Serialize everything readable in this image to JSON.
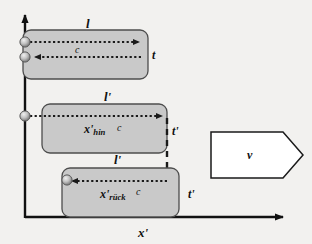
{
  "figure": {
    "background_color": "#f2f1ef",
    "box_fill_color": "#c9c9c9",
    "box_stroke_color": "#4d4d4d",
    "line_color": "#1a1a1a",
    "velocity_box_fill": "#ffffff"
  },
  "axes": {
    "x_axis_label": "x'",
    "y_axis_label": "",
    "x_axis_name": "horizontal-axis",
    "y_axis_name": "vertical-axis"
  },
  "frames": [
    {
      "id": "rest-frame",
      "length_label": "l",
      "speed_label": "c",
      "time_label": "t",
      "distance_label": "",
      "arrow_direction": "right",
      "markers": 2
    },
    {
      "id": "moving-frame-outbound",
      "length_label": "l'",
      "speed_label": "c",
      "time_label": "t'",
      "distance_label": "x'",
      "distance_subscript": "hin",
      "arrow_direction": "right",
      "markers": 1
    },
    {
      "id": "moving-frame-return",
      "length_label": "l'",
      "speed_label": "c",
      "time_label": "t'",
      "distance_label": "x'",
      "distance_subscript": "rück",
      "arrow_direction": "left",
      "markers": 1
    }
  ],
  "velocity_indicator": {
    "label": "v",
    "shape": "right-pointing-pentagon"
  }
}
